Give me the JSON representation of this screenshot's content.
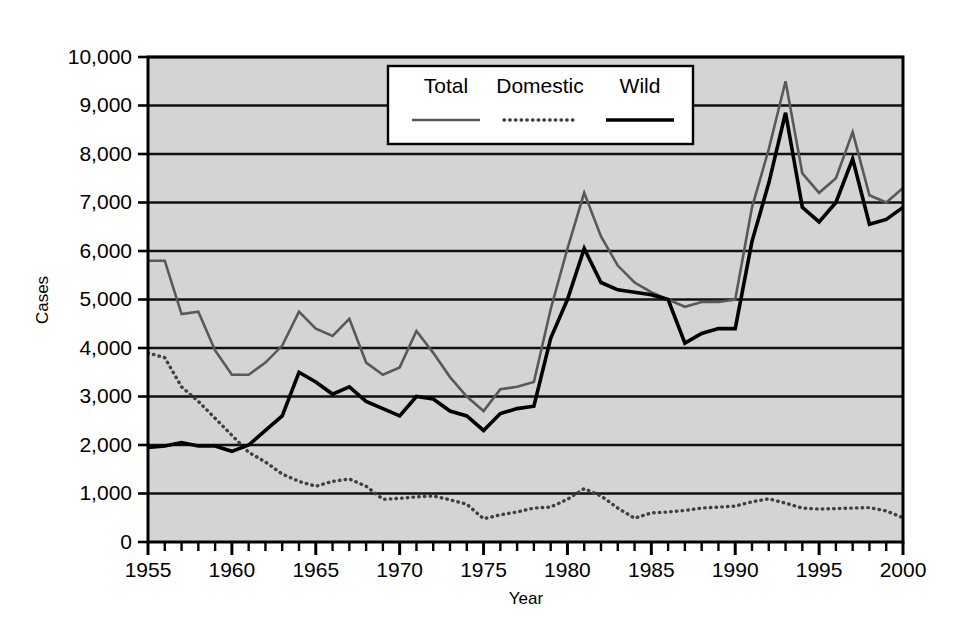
{
  "chart_data": {
    "type": "line",
    "title": "",
    "xlabel": "Year",
    "ylabel": "Cases",
    "xlim": [
      1955,
      2000
    ],
    "ylim": [
      0,
      10000
    ],
    "grid": true,
    "legend_position": "top-center",
    "plot_background": "#d4d4d4",
    "x": [
      1955,
      1956,
      1957,
      1958,
      1959,
      1960,
      1961,
      1962,
      1963,
      1964,
      1965,
      1966,
      1967,
      1968,
      1969,
      1970,
      1971,
      1972,
      1973,
      1974,
      1975,
      1976,
      1977,
      1978,
      1979,
      1980,
      1981,
      1982,
      1983,
      1984,
      1985,
      1986,
      1987,
      1988,
      1989,
      1990,
      1991,
      1992,
      1993,
      1994,
      1995,
      1996,
      1997,
      1998,
      1999,
      2000
    ],
    "xticks": [
      1955,
      1960,
      1965,
      1970,
      1975,
      1980,
      1985,
      1990,
      1995,
      2000
    ],
    "xtick_labels": [
      "1955",
      "1960",
      "1965",
      "1970",
      "1975",
      "1980",
      "1985",
      "1990",
      "1995",
      "2000"
    ],
    "yticks": [
      0,
      1000,
      2000,
      3000,
      4000,
      5000,
      6000,
      7000,
      8000,
      9000,
      10000
    ],
    "ytick_labels": [
      "0",
      "1,000",
      "2,000",
      "3,000",
      "4,000",
      "5,000",
      "6,000",
      "7,000",
      "8,000",
      "9,000",
      "10,000"
    ],
    "series": [
      {
        "name": "Total",
        "color": "#595959",
        "style": "solid",
        "width": 2.6,
        "values": [
          5800,
          5800,
          4700,
          4750,
          3950,
          3450,
          3450,
          3700,
          4050,
          4750,
          4400,
          4250,
          4600,
          3700,
          3450,
          3600,
          4350,
          3900,
          3400,
          3000,
          2700,
          3150,
          3200,
          3300,
          4800,
          6050,
          7200,
          6300,
          5700,
          5350,
          5150,
          5000,
          4850,
          4950,
          4950,
          5000,
          6900,
          8100,
          9500,
          7600,
          7200,
          7500,
          8450,
          7150,
          7000,
          7300
        ]
      },
      {
        "name": "Domestic",
        "color": "#404040",
        "style": "dotted",
        "width": 3.4,
        "values": [
          3900,
          3800,
          3200,
          2900,
          2550,
          2200,
          1850,
          1650,
          1400,
          1250,
          1150,
          1250,
          1300,
          1150,
          880,
          900,
          930,
          950,
          870,
          780,
          480,
          560,
          620,
          700,
          720,
          880,
          1100,
          950,
          700,
          490,
          600,
          620,
          650,
          700,
          720,
          740,
          830,
          890,
          800,
          700,
          680,
          690,
          700,
          710,
          640,
          500
        ]
      },
      {
        "name": "Wild",
        "color": "#000000",
        "style": "solid",
        "width": 3.6,
        "values": [
          1950,
          1980,
          2050,
          1980,
          1980,
          1870,
          2000,
          2300,
          2600,
          3500,
          3300,
          3050,
          3200,
          2900,
          2750,
          2600,
          3000,
          2950,
          2700,
          2600,
          2300,
          2650,
          2750,
          2800,
          4200,
          5000,
          6050,
          5350,
          5200,
          5150,
          5100,
          5000,
          4100,
          4300,
          4400,
          4400,
          6200,
          7400,
          8850,
          6900,
          6600,
          7000,
          7900,
          6550,
          6650,
          6900
        ]
      }
    ]
  },
  "legend": {
    "items": [
      {
        "label": "Total",
        "key": "total"
      },
      {
        "label": "Domestic",
        "key": "domestic"
      },
      {
        "label": "Wild",
        "key": "wild"
      }
    ]
  },
  "axes": {
    "x_title": "Year",
    "y_title": "Cases"
  }
}
